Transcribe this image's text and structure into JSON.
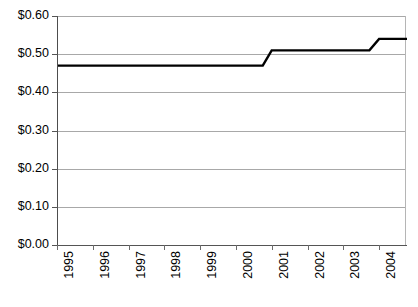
{
  "chart_data": {
    "type": "line",
    "title": "",
    "subtitle": "",
    "xlabel": "",
    "ylabel": "",
    "legend": [],
    "legend_position": "none",
    "grid": true,
    "grid_axis": "y",
    "line_color": "#000000",
    "gridline_color": "#a8a8a8",
    "axis_color": "#555555",
    "background_color": "#ffffff",
    "step_style": "ramped-step",
    "x": [
      1995,
      1996,
      1997,
      1998,
      1999,
      2000,
      2001,
      2002,
      2003,
      2004
    ],
    "xtick_labels": [
      "1995",
      "1996",
      "1997",
      "1998",
      "1999",
      "2000",
      "2001",
      "2002",
      "2003",
      "2004"
    ],
    "xlim": [
      1995,
      2004.75
    ],
    "ylim": [
      0.0,
      0.6
    ],
    "ytick_values": [
      0.0,
      0.1,
      0.2,
      0.3,
      0.4,
      0.5,
      0.6
    ],
    "ytick_labels": [
      "$0.00",
      "$0.10",
      "$0.20",
      "$0.30",
      "$0.40",
      "$0.50",
      "$0.60"
    ],
    "values": [
      0.47,
      0.47,
      0.47,
      0.47,
      0.47,
      0.47,
      0.51,
      0.51,
      0.51,
      0.54
    ],
    "series": [
      {
        "name": "price",
        "points": [
          {
            "x": 1995.0,
            "y": 0.47
          },
          {
            "x": 2000.72,
            "y": 0.47
          },
          {
            "x": 2000.97,
            "y": 0.51
          },
          {
            "x": 2003.7,
            "y": 0.51
          },
          {
            "x": 2003.97,
            "y": 0.54
          },
          {
            "x": 2004.75,
            "y": 0.54
          }
        ]
      }
    ],
    "annotations": []
  }
}
